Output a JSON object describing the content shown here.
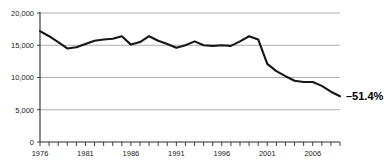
{
  "chart_data": {
    "type": "line",
    "title": "",
    "subtitle": "",
    "xlabel": "",
    "ylabel": "",
    "xlim": [
      1976,
      2009
    ],
    "ylim": [
      0,
      20000
    ],
    "grid": true,
    "legend_position": "none",
    "y_ticks": [
      0,
      5000,
      10000,
      15000,
      20000
    ],
    "y_tick_labels": [
      "0",
      "5,000",
      "10,000",
      "15,000",
      "20,000"
    ],
    "x_ticks": [
      1976,
      1981,
      1986,
      1991,
      1996,
      2001,
      2006
    ],
    "x_tick_labels": [
      "1976",
      "1981",
      "1986",
      "1991",
      "1996",
      "2001",
      "2006"
    ],
    "x_minor_ticks": [
      1976,
      1977,
      1978,
      1979,
      1980,
      1981,
      1982,
      1983,
      1984,
      1985,
      1986,
      1987,
      1988,
      1989,
      1990,
      1991,
      1992,
      1993,
      1994,
      1995,
      1996,
      1997,
      1998,
      1999,
      2000,
      2001,
      2002,
      2003,
      2004,
      2005,
      2006,
      2007,
      2008,
      2009
    ],
    "x": [
      1976,
      1977,
      1978,
      1979,
      1980,
      1981,
      1982,
      1983,
      1984,
      1985,
      1986,
      1987,
      1988,
      1989,
      1990,
      1991,
      1992,
      1993,
      1994,
      1995,
      1996,
      1997,
      1998,
      1999,
      2000,
      2001,
      2002,
      2003,
      2004,
      2005,
      2006,
      2007,
      2008,
      2009
    ],
    "series": [
      {
        "name": "value",
        "values": [
          17200,
          16400,
          15500,
          14500,
          14700,
          15200,
          15700,
          15900,
          16000,
          16400,
          15100,
          15500,
          16400,
          15700,
          15200,
          14600,
          15000,
          15600,
          15000,
          14900,
          15000,
          14900,
          15600,
          16400,
          15900,
          12100,
          11000,
          10200,
          9500,
          9300,
          9300,
          8700,
          7800,
          7100
        ]
      }
    ],
    "annotations": [
      {
        "name": "change-annotation",
        "text": "–51.4%",
        "x": 2009,
        "y": 7100
      }
    ],
    "colors": {
      "line": "#161616",
      "grid": "#9a9a9a",
      "axis": "#2b2b2b",
      "text": "#1a1a1a",
      "background": "#ffffff"
    }
  }
}
